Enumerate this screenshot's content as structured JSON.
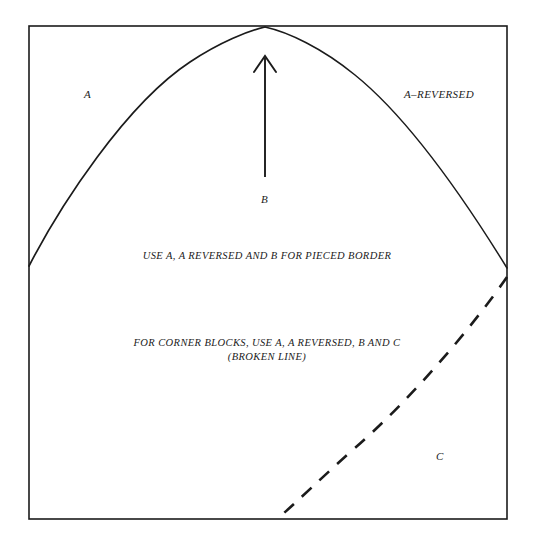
{
  "figure": {
    "background_color": "#ffffff",
    "ink_color": "#1b1b1b",
    "frame": {
      "name": "outer-rectangle",
      "x": 29,
      "y": 26,
      "width": 478,
      "height": 493
    },
    "labels": {
      "a": "A",
      "a_reversed": "A–REVERSED",
      "b": "B",
      "c": "C"
    },
    "instructions": {
      "pieced_border": "USE A, A REVERSED AND B FOR PIECED BORDER",
      "corner_blocks_line1": "FOR CORNER BLOCKS, USE A, A REVERSED, B AND C",
      "corner_blocks_line2": "(BROKEN LINE)"
    },
    "elements": {
      "left_arc": "solid-curve-from-left-edge-to-top-peak",
      "right_arc": "solid-curve-from-top-peak-to-right-edge",
      "arrow": "vertical-up-arrow-pointing-to-peak",
      "dashed_curve": "broken-line-from-right-edge-to-bottom-edge"
    }
  }
}
